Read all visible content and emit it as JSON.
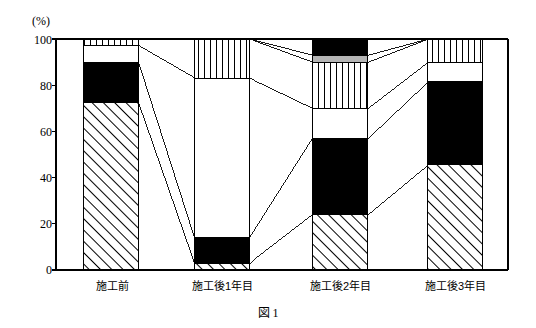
{
  "figure": {
    "caption": "図 1",
    "unit_label": "(%)"
  },
  "chart_data": {
    "type": "bar",
    "title": "図 1",
    "subtitle": "",
    "xlabel": "",
    "ylabel": "(%)",
    "ylim": [
      0,
      100
    ],
    "yticks": [
      0,
      20,
      40,
      60,
      80,
      100
    ],
    "ytick_labels": [
      "0",
      "20",
      "40",
      "60",
      "80",
      "100"
    ],
    "grid": false,
    "legend": "none",
    "stacked": true,
    "stack_total": 100,
    "categories": [
      "施工前",
      "施工後1年目",
      "施工後2年目",
      "施工後3年目"
    ],
    "series": [
      {
        "name": "hatched-diagonal",
        "pattern": "diagonal-hatch",
        "color": "#ffffff",
        "values": [
          72.5,
          3.0,
          24.0,
          45.5
        ]
      },
      {
        "name": "solid-black",
        "pattern": "solid",
        "color": "#000000",
        "values": [
          17.5,
          11.0,
          33.0,
          36.0
        ]
      },
      {
        "name": "plain-white",
        "pattern": "blank",
        "color": "#ffffff",
        "values": [
          7.0,
          69.0,
          13.0,
          8.5
        ]
      },
      {
        "name": "vertical-stripe",
        "pattern": "vertical-lines",
        "color": "#ffffff",
        "values": [
          3.0,
          17.0,
          20.0,
          10.0
        ]
      },
      {
        "name": "solid-gray",
        "pattern": "solid",
        "color": "#b5b5b5",
        "values": [
          0.0,
          0.0,
          3.0,
          0.0
        ]
      },
      {
        "name": "solid-black-top",
        "pattern": "solid",
        "color": "#000000",
        "values": [
          0.0,
          0.0,
          7.0,
          0.0
        ]
      }
    ],
    "boundaries": {
      "施工前": [
        0,
        72.5,
        90,
        97,
        100,
        100,
        100
      ],
      "施工後1年目": [
        0,
        3,
        14,
        83,
        100,
        100,
        100
      ],
      "施工後2年目": [
        0,
        24,
        57,
        70,
        90,
        93,
        100
      ],
      "施工後3年目": [
        0,
        45.5,
        81.5,
        90,
        100,
        100,
        100
      ]
    },
    "annotation": "Connecting flow lines link equivalent stack boundaries between adjacent categories."
  }
}
